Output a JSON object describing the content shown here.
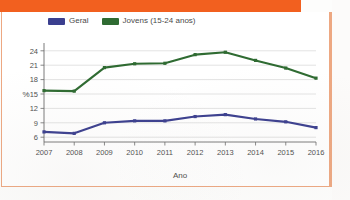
{
  "frame": {
    "banner_color": "#f2601f",
    "border_color": "#eda882"
  },
  "legend": {
    "position": "top-left",
    "items": [
      {
        "label": "Geral",
        "color": "#3b3f8f",
        "swatch_name": "legend-swatch-geral"
      },
      {
        "label": "Jovens (15-24 anos)",
        "color": "#2f6b32",
        "swatch_name": "legend-swatch-jovens"
      }
    ]
  },
  "chart_data": {
    "type": "line",
    "title": "",
    "xlabel": "Ano",
    "ylabel": "%",
    "categories": [
      "2007",
      "2008",
      "2009",
      "2010",
      "2011",
      "2012",
      "2013",
      "2014",
      "2015",
      "2016"
    ],
    "x": [
      2007,
      2008,
      2009,
      2010,
      2011,
      2012,
      2013,
      2014,
      2015,
      2016
    ],
    "yticks": [
      6,
      9,
      12,
      15,
      18,
      21,
      24
    ],
    "ylim": [
      5.0,
      25.0
    ],
    "grid": "horizontal",
    "legend_position": "top-left",
    "markers": true,
    "series": [
      {
        "name": "Geral",
        "color": "#3b3f8f",
        "values": [
          7.1,
          6.8,
          9.0,
          9.4,
          9.4,
          10.3,
          10.7,
          9.8,
          9.2,
          8.0
        ]
      },
      {
        "name": "Jovens (15-24 anos)",
        "color": "#2f6b32",
        "values": [
          15.7,
          15.6,
          20.5,
          21.3,
          21.4,
          23.2,
          23.7,
          22.0,
          20.4,
          18.3
        ]
      }
    ]
  }
}
